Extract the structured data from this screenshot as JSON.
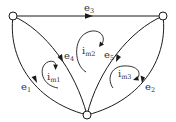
{
  "diagram": {
    "type": "circuit-graph",
    "colors": {
      "stroke": "#1a1a1a",
      "text": "#333333",
      "background": "#ffffff"
    },
    "nodes": [
      {
        "id": "n1",
        "position": "top-left"
      },
      {
        "id": "n2",
        "position": "top-right"
      },
      {
        "id": "n3",
        "position": "bottom"
      }
    ],
    "edges": [
      {
        "id": "e1",
        "label": "e",
        "sub": "1",
        "from": "n1",
        "to": "n3",
        "shape": "outer-left-curve"
      },
      {
        "id": "e2",
        "label": "e",
        "sub": "2",
        "from": "n2",
        "to": "n3",
        "shape": "outer-right-curve"
      },
      {
        "id": "e3",
        "label": "e",
        "sub": "3",
        "from": "n1",
        "to": "n2",
        "shape": "straight-top"
      },
      {
        "id": "e4",
        "label": "e",
        "sub": "4",
        "from": "n1",
        "to": "n3",
        "shape": "inner-left-curve"
      },
      {
        "id": "e5",
        "label": "e",
        "sub": "5",
        "from": "n2",
        "to": "n3",
        "shape": "inner-right-curve"
      }
    ],
    "mesh_currents": [
      {
        "id": "im1",
        "label": "i",
        "sub": "m1",
        "direction": "clockwise"
      },
      {
        "id": "im2",
        "label": "i",
        "sub": "m2",
        "direction": "clockwise"
      },
      {
        "id": "im3",
        "label": "i",
        "sub": "m3",
        "direction": "clockwise"
      }
    ]
  }
}
